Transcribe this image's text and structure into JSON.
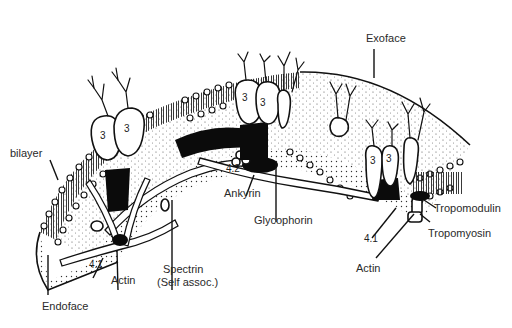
{
  "figure": {
    "background": "#ffffff",
    "ink_color": "#111111",
    "labels": {
      "bilayer": "bilayer",
      "endoface": "Endoface",
      "exoface": "Exoface",
      "actin_left": "Actin",
      "band41_left": "4.1",
      "spectrin_line1": "Spectrin",
      "spectrin_line2": "(Self assoc.)",
      "ankyrin": "Ankyrin",
      "band42": "4.2",
      "glycophorin": "Glycophorin",
      "band41_right": "4.1",
      "actin_right": "Actin",
      "tropomodulin": "Tropomodulin",
      "tropomyosin": "Tropomyosin"
    },
    "band3_markers": [
      "3",
      "3",
      "3",
      "3",
      "3",
      "3"
    ]
  }
}
